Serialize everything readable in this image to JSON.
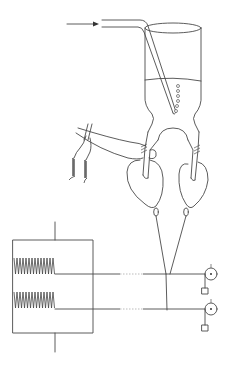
{
  "figure": {
    "title": "",
    "colors": {
      "line": "#4a4a4a",
      "background": "#ffffff",
      "dashed_segment": "#bbbbbb"
    }
  },
  "components": {
    "inlet_arrow": {
      "label": "",
      "direction": "right"
    },
    "gas_tube": {
      "label": ""
    },
    "bath_vessel": {
      "label": "",
      "bubble_count": 6
    },
    "tissue_left": {
      "label": ""
    },
    "tissue_right": {
      "label": ""
    },
    "electrode_leads": {
      "count": 2,
      "label": ""
    },
    "transducer_frame": {
      "label": "",
      "spring_count": 2
    },
    "threads": {
      "count": 2
    },
    "pulleys": {
      "count": 2
    },
    "weights": {
      "count": 2
    }
  }
}
